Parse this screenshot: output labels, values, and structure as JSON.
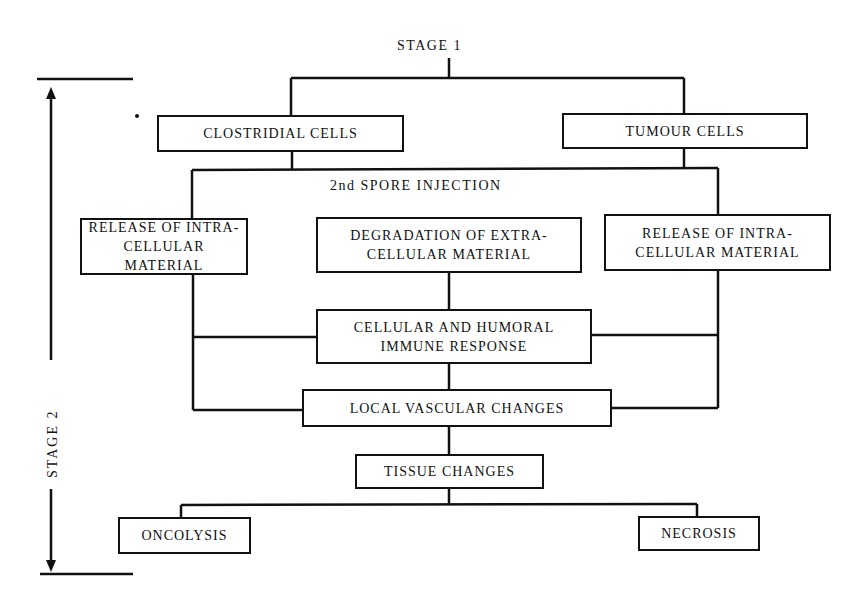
{
  "diagram": {
    "stage1_label": "STAGE   1",
    "stage2_label": "STAGE   2",
    "nodes": {
      "clostridial": "CLOSTRIDIAL CELLS",
      "tumour": "TUMOUR CELLS",
      "spore": "2nd  SPORE INJECTION",
      "release_left": "RELEASE OF INTRA-\nCELLULAR MATERIAL",
      "degradation": "DEGRADATION OF EXTRA-\nCELLULAR MATERIAL",
      "release_right": "RELEASE OF INTRA-\nCELLULAR MATERIAL",
      "immune": "CELLULAR AND HUMORAL\nIMMUNE RESPONSE",
      "vascular": "LOCAL VASCULAR CHANGES",
      "tissue": "TISSUE CHANGES",
      "oncolysis": "ONCOLYSIS",
      "necrosis": "NECROSIS"
    },
    "edges": [
      [
        "stage1",
        "clostridial"
      ],
      [
        "stage1",
        "tumour"
      ],
      [
        "clostridial",
        "spore"
      ],
      [
        "tumour",
        "spore"
      ],
      [
        "spore",
        "release_left"
      ],
      [
        "spore",
        "release_right"
      ],
      [
        "degradation",
        "immune"
      ],
      [
        "release_left",
        "immune"
      ],
      [
        "release_right",
        "immune"
      ],
      [
        "immune",
        "vascular"
      ],
      [
        "release_left",
        "vascular"
      ],
      [
        "release_right",
        "vascular"
      ],
      [
        "vascular",
        "tissue"
      ],
      [
        "tissue",
        "oncolysis"
      ],
      [
        "tissue",
        "necrosis"
      ]
    ],
    "line_color": "#111111"
  }
}
